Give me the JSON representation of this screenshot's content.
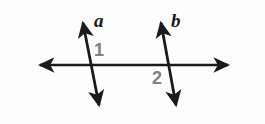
{
  "figure": {
    "name": "two-transversal-lines-diagram",
    "background_color": "#fdfdfd",
    "width": 265,
    "height": 124,
    "stroke_color": "#1a1a1a",
    "label_color": "#1a1a1a",
    "angle_label_color": "#808080",
    "horizontal_line": {
      "name": "horizontal-transversal",
      "x1": 29,
      "y1": 65,
      "x2": 239,
      "y2": 65,
      "arrow_start": true,
      "arrow_end": true,
      "stroke_width": 2.6
    },
    "lines": [
      {
        "id": "line-a",
        "label": "a",
        "x1": 81,
        "y1": 13,
        "x2": 101,
        "y2": 115,
        "arrow_start": true,
        "arrow_end": true,
        "stroke_width": 2.8
      },
      {
        "id": "line-b",
        "label": "b",
        "x1": 159,
        "y1": 13,
        "x2": 178,
        "y2": 115,
        "arrow_start": true,
        "arrow_end": true,
        "stroke_width": 2.8
      }
    ],
    "angles": [
      {
        "id": "angle-1",
        "label": "1"
      },
      {
        "id": "angle-2",
        "label": "2"
      }
    ]
  }
}
